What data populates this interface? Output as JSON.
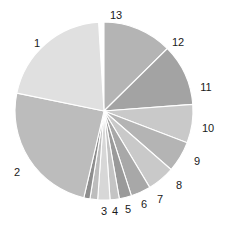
{
  "chart_data": {
    "type": "pie",
    "title": "",
    "subtitle": "",
    "xlabel": "",
    "ylabel": "",
    "legend_position": "none",
    "grid": false,
    "label_style": "outside-numeric",
    "slice_border_color": "#ffffff",
    "background_color": "#ffffff",
    "center": {
      "x": 104,
      "y": 111
    },
    "radius": 89,
    "start_angle_deg": -90,
    "direction": "clockwise",
    "labels": [
      "13",
      "12",
      "11",
      "10",
      "9",
      "8",
      "7",
      "6",
      "5",
      "4",
      "3",
      "2",
      "1"
    ],
    "values": [
      12.6,
      11.2,
      7.0,
      5.6,
      5.0,
      3.6,
      2.2,
      1.7,
      2.2,
      1.4,
      1.1,
      24.6,
      20.8
    ],
    "angles_deg": [
      45.4,
      40.3,
      25.2,
      20.2,
      18.0,
      13.0,
      8.0,
      6.0,
      8.0,
      5.0,
      4.0,
      88.5,
      74.9
    ],
    "slices": [
      {
        "label": "13",
        "value": 12.6,
        "angle_deg": 45.4,
        "color": "#b4b4b4",
        "label_x": 116,
        "label_y": 15
      },
      {
        "label": "12",
        "value": 11.2,
        "angle_deg": 40.3,
        "color": "#a3a3a3",
        "label_x": 178,
        "label_y": 42
      },
      {
        "label": "11",
        "value": 7.0,
        "angle_deg": 25.2,
        "color": "#c9c9c9",
        "label_x": 206,
        "label_y": 87
      },
      {
        "label": "10",
        "value": 5.6,
        "angle_deg": 20.2,
        "color": "#b4b4b4",
        "label_x": 208,
        "label_y": 128
      },
      {
        "label": "9",
        "value": 5.0,
        "angle_deg": 18.0,
        "color": "#c9c9c9",
        "label_x": 197,
        "label_y": 161
      },
      {
        "label": "8",
        "value": 3.6,
        "angle_deg": 13.0,
        "color": "#a8a8a8",
        "label_x": 179,
        "label_y": 185
      },
      {
        "label": "7",
        "value": 2.2,
        "angle_deg": 8.0,
        "color": "#9a9a9a",
        "label_x": 160,
        "label_y": 199
      },
      {
        "label": "6",
        "value": 1.7,
        "angle_deg": 6.0,
        "color": "#c4c4c4",
        "label_x": 144,
        "label_y": 204
      },
      {
        "label": "5",
        "value": 2.2,
        "angle_deg": 8.0,
        "color": "#d7d7d7",
        "label_x": 128,
        "label_y": 209
      },
      {
        "label": "4",
        "value": 1.4,
        "angle_deg": 5.0,
        "color": "#bdbdbd",
        "label_x": 115,
        "label_y": 211
      },
      {
        "label": "3",
        "value": 1.1,
        "angle_deg": 4.0,
        "color": "#8e8e8e",
        "label_x": 104,
        "label_y": 211
      },
      {
        "label": "2",
        "value": 24.6,
        "angle_deg": 88.5,
        "color": "#bcbcbc",
        "label_x": 17,
        "label_y": 172
      },
      {
        "label": "1",
        "value": 20.8,
        "angle_deg": 74.9,
        "color": "#e0e0e0",
        "label_x": 37,
        "label_y": 43
      }
    ]
  }
}
